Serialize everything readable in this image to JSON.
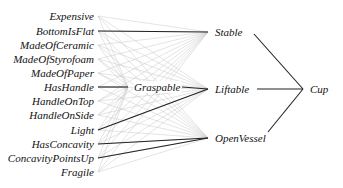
{
  "diagram": {
    "type": "network",
    "input_nodes": [
      {
        "id": "expensive",
        "label": "Expensive",
        "y": 16
      },
      {
        "id": "bottomisflat",
        "label": "BottomIsFlat",
        "y": 31
      },
      {
        "id": "madeofceramic",
        "label": "MadeOfCeramic",
        "y": 45
      },
      {
        "id": "madeofstyrofoam",
        "label": "MadeOfStyrofoam",
        "y": 59
      },
      {
        "id": "madeofpaper",
        "label": "MadeOfPaper",
        "y": 73
      },
      {
        "id": "hashandle",
        "label": "HasHandle",
        "y": 87
      },
      {
        "id": "handleontop",
        "label": "HandleOnTop",
        "y": 101
      },
      {
        "id": "handleonside",
        "label": "HandleOnSide",
        "y": 115
      },
      {
        "id": "light",
        "label": "Light",
        "y": 130
      },
      {
        "id": "hasconcavity",
        "label": "HasConcavity",
        "y": 144
      },
      {
        "id": "concavitypointsup",
        "label": "ConcavityPointsUp",
        "y": 158
      },
      {
        "id": "fragile",
        "label": "Fragile",
        "y": 172
      }
    ],
    "hidden_nodes": [
      {
        "id": "graspable",
        "label": "Graspable",
        "x": 133,
        "y": 87
      }
    ],
    "intermediate_nodes": [
      {
        "id": "stable",
        "label": "Stable",
        "x": 215,
        "y": 32
      },
      {
        "id": "liftable",
        "label": "Liftable",
        "x": 215,
        "y": 89
      },
      {
        "id": "openvessel",
        "label": "OpenVessel",
        "x": 215,
        "y": 138
      }
    ],
    "output_node": {
      "id": "cup",
      "label": "Cup",
      "x": 310,
      "y": 89
    },
    "strong_edges": [
      [
        "bottomisflat",
        "stable"
      ],
      [
        "hashandle",
        "graspable"
      ],
      [
        "light",
        "liftable"
      ],
      [
        "hasconcavity",
        "openvessel"
      ],
      [
        "concavitypointsup",
        "openvessel"
      ],
      [
        "graspable",
        "liftable"
      ],
      [
        "stable",
        "cup"
      ],
      [
        "liftable",
        "cup"
      ],
      [
        "openvessel",
        "cup"
      ]
    ],
    "weak_edges": "all input nodes to graspable, stable, liftable, openvessel",
    "colors": {
      "strong_edge": "#222222",
      "weak_edge": "#c8c8c8",
      "text": "#111111"
    }
  }
}
